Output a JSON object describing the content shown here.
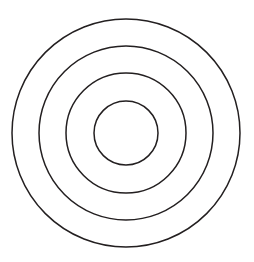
{
  "figure": {
    "type": "concentric-circles-diagram",
    "canvas": {
      "width": 254,
      "height": 262,
      "background_color": "#ffffff"
    },
    "center": {
      "x": 126,
      "y": 133
    },
    "stroke_color": "#231f20",
    "stroke_width": 1.5,
    "fill": "none",
    "ring_count": 4,
    "rings": [
      {
        "index": 1,
        "name": "outer-circle",
        "radius": 114,
        "diameter": 228,
        "stroke_color": "#231f20",
        "stroke_width": 1.5,
        "fill": "none"
      },
      {
        "index": 2,
        "name": "second-circle",
        "radius": 87,
        "diameter": 174,
        "stroke_color": "#231f20",
        "stroke_width": 1.5,
        "fill": "none"
      },
      {
        "index": 3,
        "name": "third-circle",
        "radius": 60,
        "diameter": 120,
        "stroke_color": "#231f20",
        "stroke_width": 1.5,
        "fill": "none"
      },
      {
        "index": 4,
        "name": "inner-circle",
        "radius": 32,
        "diameter": 64,
        "stroke_color": "#231f20",
        "stroke_width": 1.5,
        "fill": "none"
      }
    ]
  }
}
